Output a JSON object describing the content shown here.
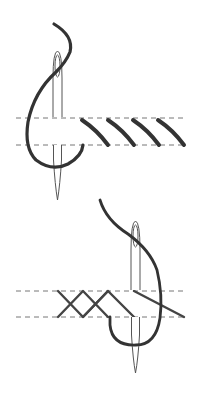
{
  "diagram": {
    "title": "Embroidery stitch illustration",
    "background": "#ffffff",
    "colors": {
      "thread": "#333333",
      "needle": "#555555",
      "guideline": "#777777"
    },
    "panels": [
      {
        "name": "top",
        "description": "Needle with thread forming slanted parallel stitches between two guide lines",
        "guidelines_y": [
          118,
          145
        ],
        "stitch_count": 4
      },
      {
        "name": "bottom",
        "description": "Needle with thread forming crossed zigzag stitches between two guide lines",
        "guidelines_y": [
          291,
          317
        ],
        "crossings": 3
      }
    ]
  }
}
